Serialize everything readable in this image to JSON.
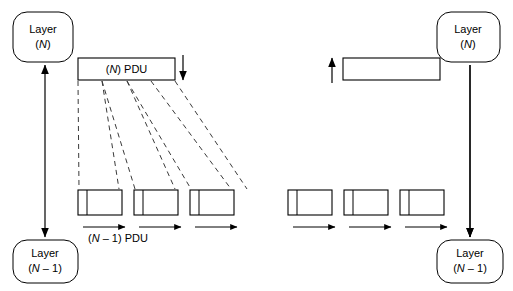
{
  "diagram": {
    "colors": {
      "stroke": "#000000",
      "dashed": "#3a3a3a",
      "background": "#ffffff"
    },
    "nodes": {
      "sender_layer_n": {
        "line1": "Layer",
        "line2": "(N)"
      },
      "sender_layer_n_minus_1": {
        "line1": "Layer",
        "line2": "(N – 1)"
      },
      "receiver_layer_n": {
        "line1": "Layer",
        "line2": "(N)"
      },
      "receiver_layer_n_minus_1": {
        "line1": "Layer",
        "line2": "(N – 1)"
      }
    },
    "labels": {
      "n_pdu": "(N) PDU",
      "n_minus_1_pdu": "(N – 1) PDU"
    },
    "sender": {
      "pdu_box": {
        "x": 78,
        "y": 58,
        "width": 97,
        "height": 22,
        "segments": 4
      },
      "down_arrow": {
        "x": 183,
        "y1": 55,
        "y2": 83,
        "direction": "down"
      },
      "fragments": [
        {
          "x": 78,
          "y": 190,
          "width": 44,
          "height": 25,
          "header_width": 9
        },
        {
          "x": 134,
          "y": 190,
          "width": 44,
          "height": 25,
          "header_width": 9
        },
        {
          "x": 190,
          "y": 190,
          "width": 44,
          "height": 25,
          "header_width": 9
        }
      ],
      "fragment_arrows": [
        {
          "x1": 83,
          "x2": 127,
          "y": 227,
          "direction": "right"
        },
        {
          "x1": 139,
          "x2": 183,
          "y": 227,
          "direction": "right"
        },
        {
          "x1": 195,
          "x2": 239,
          "y": 227,
          "direction": "right"
        }
      ],
      "vertical_arrow": {
        "x": 45,
        "y1": 62,
        "y2": 240,
        "direction": "both"
      }
    },
    "receiver": {
      "pdu_box": {
        "x": 343,
        "y": 58,
        "width": 97,
        "height": 22,
        "segments": 0
      },
      "up_arrow": {
        "x": 332,
        "y1": 83,
        "y2": 55,
        "direction": "up"
      },
      "fragments": [
        {
          "x": 288,
          "y": 190,
          "width": 44,
          "height": 25,
          "header_width": 9
        },
        {
          "x": 344,
          "y": 190,
          "width": 44,
          "height": 25,
          "header_width": 9
        },
        {
          "x": 400,
          "y": 190,
          "width": 44,
          "height": 25,
          "header_width": 9
        }
      ],
      "fragment_arrows": [
        {
          "x1": 293,
          "x2": 337,
          "y": 227,
          "direction": "right"
        },
        {
          "x1": 349,
          "x2": 393,
          "y": 227,
          "direction": "right"
        },
        {
          "x1": 405,
          "x2": 449,
          "y": 227,
          "direction": "right"
        }
      ],
      "vertical_arrow": {
        "x": 470,
        "y1": 62,
        "y2": 240,
        "direction": "down"
      }
    },
    "dashed_connectors": [
      {
        "from_x": 78,
        "from_y": 80,
        "to_x": 78,
        "to_y": 190
      },
      {
        "from_x": 102,
        "from_y": 80,
        "to_x": 120,
        "to_y": 190
      },
      {
        "from_x": 102,
        "from_y": 80,
        "to_x": 134,
        "to_y": 190
      },
      {
        "from_x": 127,
        "from_y": 80,
        "to_x": 176,
        "to_y": 190
      },
      {
        "from_x": 127,
        "from_y": 80,
        "to_x": 190,
        "to_y": 190
      },
      {
        "from_x": 151,
        "from_y": 80,
        "to_x": 232,
        "to_y": 190
      },
      {
        "from_x": 175,
        "from_y": 80,
        "to_x": 246,
        "to_y": 190
      }
    ]
  }
}
